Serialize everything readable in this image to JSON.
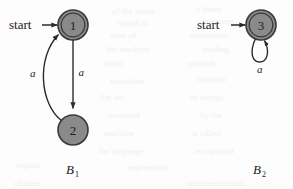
{
  "figure": {
    "caption_left": "B",
    "caption_left_sub": "1",
    "caption_right": "B",
    "caption_right_sub": "2",
    "colors": {
      "state_fill": "#8a8a8a",
      "state_stroke": "#3a3a3a",
      "edge": "#2b2b2b",
      "text": "#1a1a1a",
      "background": "#fdfdfd"
    }
  },
  "automata": [
    {
      "id": "B1",
      "name": "automaton-b1",
      "start_label": "start",
      "states": [
        {
          "id": "1",
          "label": "1",
          "cx": 73,
          "cy": 25,
          "r": 15,
          "accepting": true
        },
        {
          "id": "2",
          "label": "2",
          "cx": 73,
          "cy": 130,
          "r": 15,
          "accepting": false
        }
      ],
      "transitions": [
        {
          "from": "1",
          "to": "2",
          "label": "a",
          "shape": "straight"
        },
        {
          "from": "2",
          "to": "1",
          "label": "a",
          "shape": "curve-left"
        }
      ]
    },
    {
      "id": "B2",
      "name": "automaton-b2",
      "start_label": "start",
      "states": [
        {
          "id": "3",
          "label": "3",
          "cx": 261,
          "cy": 25,
          "r": 15,
          "accepting": true
        }
      ],
      "transitions": [
        {
          "from": "3",
          "to": "3",
          "label": "a",
          "shape": "self-loop"
        }
      ]
    }
  ],
  "bleed_through": [
    {
      "text": "of the states",
      "x": 112,
      "y": 6
    },
    {
      "text": "a finite",
      "x": 196,
      "y": 4
    },
    {
      "text": "which is",
      "x": 118,
      "y": 18
    },
    {
      "text": "an accept",
      "x": 200,
      "y": 16
    },
    {
      "text": "state of",
      "x": 110,
      "y": 30
    },
    {
      "text": "automaton",
      "x": 190,
      "y": 30
    },
    {
      "text": "the machine",
      "x": 106,
      "y": 44
    },
    {
      "text": "reading",
      "x": 202,
      "y": 44
    },
    {
      "text": "input",
      "x": 104,
      "y": 58
    },
    {
      "text": "symbols",
      "x": 186,
      "y": 58
    },
    {
      "text": "transition",
      "x": 110,
      "y": 76
    },
    {
      "text": "function",
      "x": 196,
      "y": 74
    },
    {
      "text": "the set",
      "x": 100,
      "y": 92
    },
    {
      "text": "of strings",
      "x": 190,
      "y": 92
    },
    {
      "text": "accepted",
      "x": 108,
      "y": 110
    },
    {
      "text": "by the",
      "x": 200,
      "y": 110
    },
    {
      "text": "machine",
      "x": 104,
      "y": 128
    },
    {
      "text": "is called",
      "x": 192,
      "y": 128
    },
    {
      "text": "the language",
      "x": 98,
      "y": 146
    },
    {
      "text": "recognized",
      "x": 194,
      "y": 146
    },
    {
      "text": "regular",
      "x": 16,
      "y": 160
    },
    {
      "text": "expression",
      "x": 128,
      "y": 162
    },
    {
      "text": "nondeterministic",
      "x": 186,
      "y": 178
    },
    {
      "text": "closure",
      "x": 14,
      "y": 178
    }
  ]
}
